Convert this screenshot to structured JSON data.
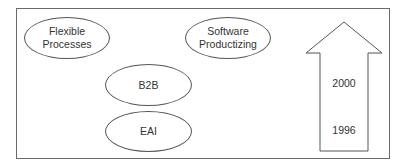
{
  "diagram": {
    "ellipses": [
      {
        "id": "flexible-processes",
        "line1": "Flexible",
        "line2": "Processes"
      },
      {
        "id": "software-productizing",
        "line1": "Software",
        "line2": "Productizing"
      },
      {
        "id": "b2b",
        "label": "B2B"
      },
      {
        "id": "eai",
        "label": "EAI"
      }
    ],
    "timeline_arrow": {
      "direction": "up",
      "labels": {
        "top": "2000",
        "bottom": "1996"
      }
    },
    "colors": {
      "stroke": "#555555",
      "background": "#ffffff"
    }
  }
}
